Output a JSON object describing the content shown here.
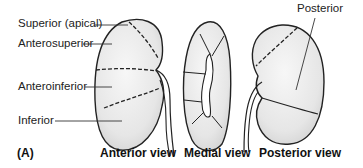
{
  "figure": {
    "panel_label": "(A)",
    "views": [
      {
        "id": "anterior",
        "caption": "Anterior view"
      },
      {
        "id": "medial",
        "caption": "Medial view"
      },
      {
        "id": "posterior",
        "caption": "Posterior view"
      }
    ],
    "segment_labels": {
      "superior": "Superior (apical)",
      "anterosuperior": "Anterosuperior",
      "anteroinferior": "Anteroinferior",
      "inferior": "Inferior",
      "posterior": "Posterior"
    },
    "colors": {
      "outline": "#222222",
      "fill": "#ebebeb",
      "shade": "#d6d6d6",
      "leader": "#333333"
    }
  }
}
